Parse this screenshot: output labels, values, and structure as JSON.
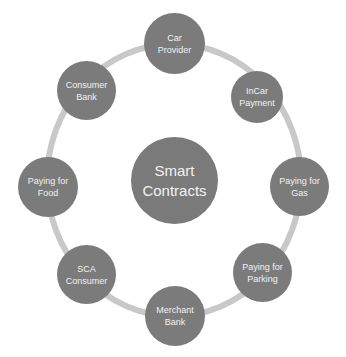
{
  "diagram": {
    "type": "hub-and-ring",
    "ring_color": "#c8c8c8",
    "node_color": "#7b7b7b",
    "text_color": "#f2f2f2",
    "center": {
      "label": "Smart Contracts",
      "line1": "Smart",
      "line2": "Contracts"
    },
    "nodes": [
      {
        "label": "Car Provider",
        "line1": "Car",
        "line2": "Provider"
      },
      {
        "label": "InCar Payment",
        "line1": "InCar",
        "line2": "Payment"
      },
      {
        "label": "Paying for Gas",
        "line1": "Paying for",
        "line2": "Gas"
      },
      {
        "label": "Paying for Parking",
        "line1": "Paying for",
        "line2": "Parking"
      },
      {
        "label": "Merchant Bank",
        "line1": "Merchant",
        "line2": "Bank"
      },
      {
        "label": "SCA Consumer",
        "line1": "SCA",
        "line2": "Consumer"
      },
      {
        "label": "Paying for Food",
        "line1": "Paying for",
        "line2": "Food"
      },
      {
        "label": "Consumer Bank",
        "line1": "Consumer",
        "line2": "Bank"
      }
    ]
  }
}
